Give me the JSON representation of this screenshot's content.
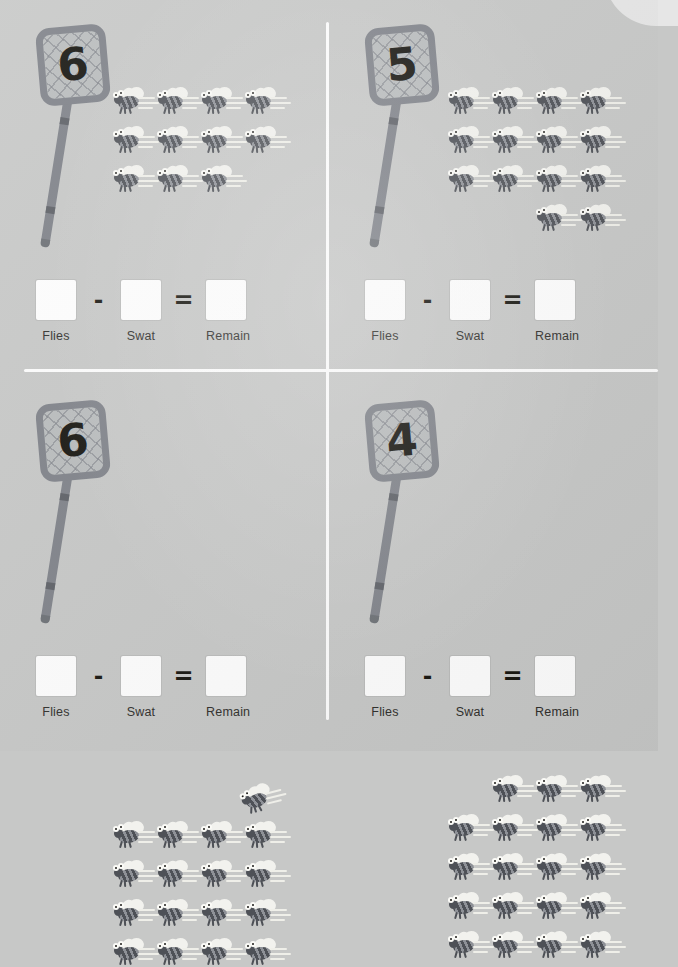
{
  "worksheet": {
    "title": "Fly Swatter Subtraction Worksheet",
    "background_color": "#c7c8c7",
    "divider_color": "#fdfdfd",
    "labels": {
      "flies": "Flies",
      "swat": "Swat",
      "remain": "Remain"
    },
    "operators": {
      "minus": "-",
      "equals": "="
    }
  },
  "problems": [
    {
      "id": "problem-1",
      "position": "top-left",
      "swatter_number": "6",
      "fly_count": 11,
      "fly_rows": [
        {
          "count": 4,
          "start_col": 0,
          "offset_x": 0,
          "offset_y": 0
        },
        {
          "count": 4,
          "start_col": 0,
          "offset_x": 0,
          "offset_y": 0
        },
        {
          "count": 3,
          "start_col": 0,
          "offset_x": 0,
          "offset_y": 0
        }
      ],
      "answer_boxes": [
        "",
        "",
        ""
      ]
    },
    {
      "id": "problem-2",
      "position": "top-right",
      "swatter_number": "5",
      "fly_count": 14,
      "fly_rows": [
        {
          "count": 4,
          "start_col": 0,
          "offset_x": 0,
          "offset_y": 0
        },
        {
          "count": 4,
          "start_col": 0,
          "offset_x": 0,
          "offset_y": 0
        },
        {
          "count": 4,
          "start_col": 0,
          "offset_x": 0,
          "offset_y": 0
        },
        {
          "count": 2,
          "start_col": 2,
          "offset_x": 0,
          "offset_y": 0
        }
      ],
      "answer_boxes": [
        "",
        "",
        ""
      ]
    },
    {
      "id": "problem-3",
      "position": "bottom-left",
      "swatter_number": "6",
      "fly_count": 17,
      "fly_rows": [
        {
          "count": 1,
          "start_col": 3,
          "offset_x": -4,
          "offset_y": -36
        },
        {
          "count": 4,
          "start_col": 0,
          "offset_x": 0,
          "offset_y": 0
        },
        {
          "count": 4,
          "start_col": 0,
          "offset_x": 0,
          "offset_y": 0
        },
        {
          "count": 4,
          "start_col": 0,
          "offset_x": 0,
          "offset_y": 0
        },
        {
          "count": 4,
          "start_col": 0,
          "offset_x": 0,
          "offset_y": 0
        }
      ],
      "answer_boxes": [
        "",
        "",
        ""
      ]
    },
    {
      "id": "problem-4",
      "position": "bottom-right",
      "swatter_number": "4",
      "fly_count": 19,
      "fly_rows": [
        {
          "count": 3,
          "start_col": 1,
          "offset_x": 0,
          "offset_y": 0
        },
        {
          "count": 4,
          "start_col": 0,
          "offset_x": 0,
          "offset_y": 0
        },
        {
          "count": 4,
          "start_col": 0,
          "offset_x": 0,
          "offset_y": 0
        },
        {
          "count": 4,
          "start_col": 0,
          "offset_x": 0,
          "offset_y": 0
        },
        {
          "count": 4,
          "start_col": 0,
          "offset_x": 0,
          "offset_y": 0
        }
      ],
      "answer_boxes": [
        "",
        "",
        ""
      ]
    }
  ],
  "layout": {
    "fly_col_step": 44,
    "fly_row_step": 39,
    "fields": [
      {
        "left": 112,
        "top": 88
      },
      {
        "left": 118,
        "top": 88
      },
      {
        "left": 112,
        "top": 446
      },
      {
        "left": 118,
        "top": 400
      }
    ]
  }
}
